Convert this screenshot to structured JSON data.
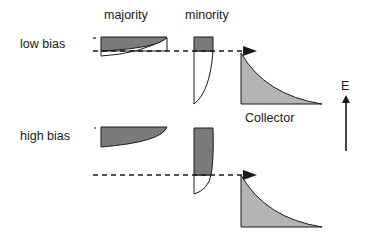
{
  "labels": {
    "majority": "majority",
    "minority": "minority",
    "low_bias": "low bias",
    "high_bias": "high bias",
    "collector": "Collector",
    "energy_axis": "E"
  },
  "colors": {
    "dark_fill": "#7a7a7a",
    "light_fill": "#b4b4b4",
    "stroke": "#1a1a1a",
    "background": "#ffffff"
  },
  "rows": [
    {
      "name": "low bias",
      "level_y": 51
    },
    {
      "name": "high bias",
      "level_y": 175
    }
  ]
}
